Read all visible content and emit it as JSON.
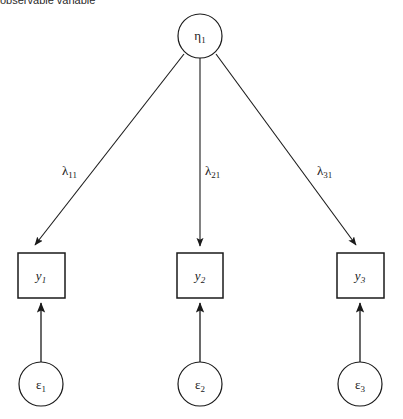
{
  "caption": {
    "text": "observable variable"
  },
  "diagram": {
    "type": "sem-path-diagram",
    "stroke_color": "#1a1a1a",
    "fill_color": "#ffffff",
    "background": "#ffffff",
    "latent": {
      "id": "eta1",
      "symbol": "η",
      "subscript": "1",
      "shape": "circle",
      "cx": 200,
      "cy": 36,
      "r": 22
    },
    "observed": [
      {
        "id": "y1",
        "symbol": "y",
        "subscript": "1",
        "shape": "rect",
        "x": 18,
        "y": 253,
        "w": 47,
        "h": 45
      },
      {
        "id": "y2",
        "symbol": "y",
        "subscript": "2",
        "shape": "rect",
        "x": 177,
        "y": 253,
        "w": 46,
        "h": 45
      },
      {
        "id": "y3",
        "symbol": "y",
        "subscript": "3",
        "shape": "rect",
        "x": 337,
        "y": 253,
        "w": 47,
        "h": 45
      }
    ],
    "errors": [
      {
        "id": "e1",
        "symbol": "ε",
        "subscript": "1",
        "shape": "circle",
        "cx": 41,
        "cy": 384,
        "r": 22
      },
      {
        "id": "e2",
        "symbol": "ε",
        "subscript": "2",
        "shape": "circle",
        "cx": 200,
        "cy": 384,
        "r": 22
      },
      {
        "id": "e3",
        "symbol": "ε",
        "subscript": "3",
        "shape": "circle",
        "cx": 360,
        "cy": 384,
        "r": 22
      }
    ],
    "loadings": [
      {
        "id": "lambda11",
        "symbol": "λ",
        "subscript": "11",
        "from": "eta1",
        "to": "y1",
        "label_x": 62,
        "label_y": 164
      },
      {
        "id": "lambda21",
        "symbol": "λ",
        "subscript": "21",
        "from": "eta1",
        "to": "y2",
        "label_x": 205,
        "label_y": 164
      },
      {
        "id": "lambda31",
        "symbol": "λ",
        "subscript": "31",
        "from": "eta1",
        "to": "y3",
        "label_x": 317,
        "label_y": 164
      }
    ],
    "error_paths": [
      {
        "id": "e1-y1",
        "from": "e1",
        "to": "y1"
      },
      {
        "id": "e2-y2",
        "from": "e2",
        "to": "y2"
      },
      {
        "id": "e3-y3",
        "from": "e3",
        "to": "y3"
      }
    ]
  }
}
